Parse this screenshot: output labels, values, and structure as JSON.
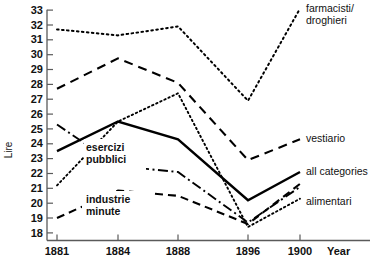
{
  "chart_data": {
    "type": "line",
    "title": "",
    "xlabel": "Year",
    "ylabel": "Lire",
    "x": [
      1881,
      1884,
      1888,
      1896,
      1900
    ],
    "xtick_labels": [
      "1881",
      "1884",
      "1888",
      "1896",
      "1900"
    ],
    "xlim": [
      1881,
      1900
    ],
    "ylim": [
      17.6,
      33.4
    ],
    "ytick_labels": [
      "18",
      "19",
      "20",
      "21",
      "22",
      "23",
      "24",
      "25",
      "26",
      "27",
      "28",
      "29",
      "30",
      "31",
      "32",
      "33"
    ],
    "yticks": [
      18,
      19,
      20,
      21,
      22,
      23,
      24,
      25,
      26,
      27,
      28,
      29,
      30,
      31,
      32,
      33
    ],
    "grid": false,
    "legend_position": "right-inline-labels",
    "series": [
      {
        "name": "farmacisti/droghieri",
        "label": "farmacisti/\ndroghieri",
        "style": "dotted",
        "values": [
          31.7,
          31.3,
          31.9,
          26.9,
          33.1
        ]
      },
      {
        "name": "vestiario",
        "label": "vestiario",
        "style": "dashed",
        "values": [
          27.7,
          29.75,
          28.1,
          22.9,
          24.3
        ]
      },
      {
        "name": "all categories",
        "label": "all categories",
        "style": "solid",
        "values": [
          23.5,
          25.5,
          24.3,
          20.2,
          22.1
        ]
      },
      {
        "name": "alimentari",
        "label": "alimentari",
        "style": "fine-dotted",
        "values": [
          21.2,
          25.5,
          27.4,
          18.4,
          20.3
        ]
      },
      {
        "name": "esercizi pubblici",
        "label": "esercizi\npubblici",
        "style": "dash-dot",
        "values": [
          25.3,
          22.5,
          22.1,
          18.7,
          21.1
        ]
      },
      {
        "name": "industrie minute",
        "label": "industrie\nminute",
        "style": "long-dashed",
        "values": [
          19.0,
          20.85,
          20.5,
          18.6,
          21.3
        ]
      }
    ],
    "annotations": [
      {
        "name": "esercizi-pubblici-annotation",
        "text_line1": "esercizi",
        "text_line2": "pubblici"
      },
      {
        "name": "industrie-minute-annotation",
        "text_line1": "industrie",
        "text_line2": "minute"
      }
    ],
    "right_labels": [
      {
        "name": "farmacisti-droghieri-label",
        "line1": "farmacisti/",
        "line2": "droghieri"
      },
      {
        "name": "vestiario-label",
        "line1": "vestiario",
        "line2": ""
      },
      {
        "name": "all-categories-label",
        "line1": "all categories",
        "line2": ""
      },
      {
        "name": "alimentari-label",
        "line1": "alimentari",
        "line2": ""
      }
    ],
    "axis_unit_label": "Lire",
    "axis_year_label": "Year"
  }
}
